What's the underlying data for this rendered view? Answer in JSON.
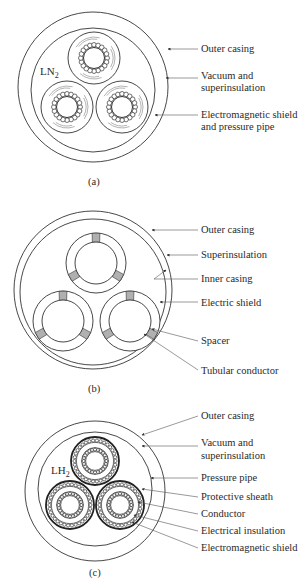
{
  "figures": [
    {
      "id": "a",
      "caption": "(a)",
      "medium_label": "LN",
      "medium_subscript": "2",
      "labels": [
        [
          "Outer casing"
        ],
        [
          "Vacuum and",
          "superinsulation"
        ],
        [
          "Electromagnetic shield",
          "and pressure pipe"
        ]
      ]
    },
    {
      "id": "b",
      "caption": "(b)",
      "labels": [
        [
          "Outer casing"
        ],
        [
          "Superinsulation"
        ],
        [
          "Inner casing"
        ],
        [
          "Electric shield"
        ],
        [
          "Spacer"
        ],
        [
          "Tubular conductor"
        ]
      ]
    },
    {
      "id": "c",
      "caption": "(c)",
      "medium_label": "LH",
      "medium_subscript": "2",
      "labels": [
        [
          "Outer casing"
        ],
        [
          "Vacuum and",
          "superinsulation"
        ],
        [
          "Pressure pipe"
        ],
        [
          "Protective sheath"
        ],
        [
          "Conductor"
        ],
        [
          "Electrical insulation"
        ],
        [
          "Electromagnetic shield"
        ]
      ]
    }
  ],
  "colors": {
    "line": "#333333",
    "spacer_fill": "#b0b0b0",
    "text": "#2a2a2a"
  }
}
